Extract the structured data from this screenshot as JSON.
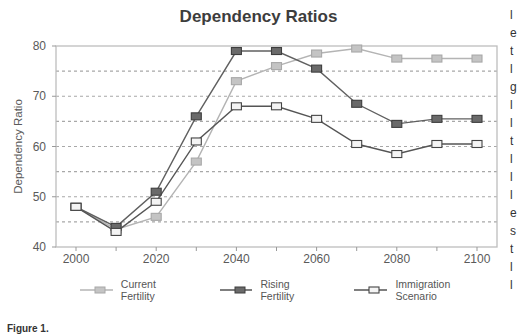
{
  "chart_data": {
    "type": "line",
    "title": "Dependency Ratios",
    "xlabel": "",
    "ylabel": "Dependency Ratio",
    "x": [
      2000,
      2010,
      2020,
      2030,
      2040,
      2050,
      2060,
      2070,
      2080,
      2090,
      2100
    ],
    "xticks": [
      2000,
      2020,
      2040,
      2060,
      2080,
      2100
    ],
    "yticks": [
      40,
      50,
      60,
      70,
      80
    ],
    "ylim": [
      40,
      80
    ],
    "xlim": [
      1995,
      2105
    ],
    "grid": "horizontal dashed every 5 units",
    "legend_position": "bottom",
    "series": [
      {
        "name": "Current Fertility",
        "color": "#b4b4b4",
        "marker": "filled-square-light",
        "values": [
          48,
          43.5,
          46,
          57,
          73,
          76,
          78.5,
          79.5,
          77.5,
          77.5,
          77.5
        ]
      },
      {
        "name": "Rising Fertility",
        "color": "#606060",
        "marker": "filled-square-dark",
        "values": [
          48,
          44,
          51,
          66,
          79,
          79,
          75.5,
          68.5,
          64.5,
          65.5,
          65.5
        ]
      },
      {
        "name": "Immigration Scenario",
        "color": "#555555",
        "marker": "hollow-square",
        "values": [
          48,
          43,
          49,
          61,
          68,
          68,
          65.5,
          60.5,
          58.5,
          60.5,
          60.5
        ]
      }
    ]
  },
  "figure": {
    "title": "Dependency Ratios",
    "ylabel": "Dependency Ratio",
    "caption": "Figure 1.",
    "legend": [
      "Current Fertility",
      "Rising Fertility",
      "Immigration Scenario"
    ],
    "edge_text": "l\ne\nt\nl\ng\nl\nl\nt\nl\nl\nl\ne\ns\nt\nl\nl"
  }
}
